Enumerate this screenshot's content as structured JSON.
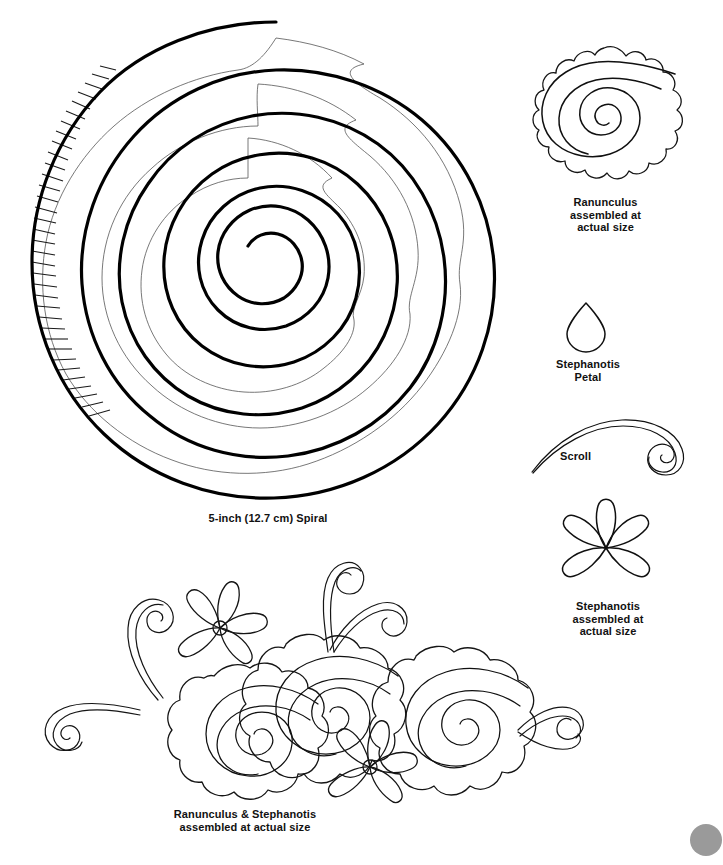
{
  "page": {
    "background_color": "#ffffff",
    "ink_color": "#000000"
  },
  "figures": {
    "spiral": {
      "name": "5-inch spiral template",
      "caption": "5-inch (12.7 cm) Spiral",
      "diameter_inches": 5,
      "diameter_cm": 12.7,
      "turns": 3.5,
      "has_hatch_marks": true,
      "hatch_side": "left"
    },
    "ranunculus": {
      "name": "Ranunculus rolled rose",
      "caption": "Ranunculus\nassembled at\nactual size"
    },
    "stephanotis_petal": {
      "name": "Stephanotis petal",
      "caption": "Stephanotis\nPetal"
    },
    "scroll": {
      "name": "Scroll curl",
      "caption": "Scroll"
    },
    "stephanotis_flower": {
      "name": "Stephanotis five petal flower",
      "caption": "Stephanotis\nassembled at\nactual size",
      "petal_count": 5
    },
    "arrangement": {
      "name": "Ranunculus and stephanotis arrangement",
      "caption": "Ranunculus & Stephanotis\nassembled at actual size",
      "rose_count": 3,
      "stephanotis_count": 2,
      "scroll_count": 4
    },
    "corner_mark": {
      "name": "page corner dot",
      "color": "#9a9a9a"
    }
  }
}
